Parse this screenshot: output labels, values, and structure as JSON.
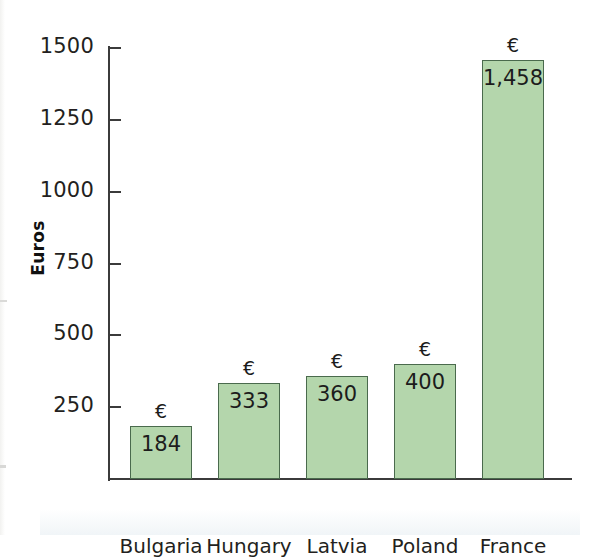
{
  "chart_data": {
    "type": "bar",
    "title": "",
    "xlabel": "",
    "ylabel": "Euros",
    "categories": [
      "Bulgaria",
      "Hungary",
      "Latvia",
      "Poland",
      "France"
    ],
    "values": [
      184,
      333,
      360,
      400,
      1458
    ],
    "value_labels": [
      "184",
      "333",
      "360",
      "400",
      "1,458"
    ],
    "currency_symbol": "€",
    "currency_markers": [
      "€",
      "€",
      "€",
      "€",
      "€"
    ],
    "ylim": [
      0,
      1500
    ],
    "yticks": [
      250,
      500,
      750,
      1000,
      1250,
      1500
    ],
    "ytick_labels": [
      "250",
      "500",
      "750",
      "1000",
      "1250",
      "1500"
    ],
    "grid": false,
    "legend": null,
    "series": [
      {
        "name": "Euros",
        "values": [
          184,
          333,
          360,
          400,
          1458
        ]
      }
    ],
    "colors": {
      "bar_fill": "#b4d6ac",
      "bar_border": "#4a6a4d",
      "axis": "#3b3b3b",
      "text": "#231f20",
      "background": "#ffffff"
    }
  }
}
